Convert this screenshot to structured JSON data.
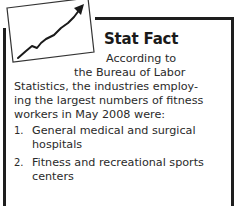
{
  "sidebar": {
    "title": "Stat Fact",
    "icon": "rising-line-chart-icon",
    "intro_lines": [
      "According to",
      "the Bureau of Labor",
      "Statistics, the industries employ-",
      "ing the largest numbers of fitness",
      "workers in May 2008 were:"
    ],
    "list": [
      {
        "num": "1.",
        "text": "General medical and surgical hospitals"
      },
      {
        "num": "2.",
        "text": "Fitness and recreational sports centers"
      }
    ]
  },
  "colors": {
    "border": "#1e1e1e",
    "text": "#2a2a2a",
    "background": "#ffffff"
  }
}
